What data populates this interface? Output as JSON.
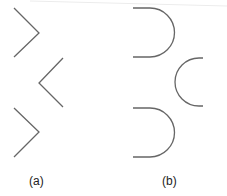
{
  "figure": {
    "stroke_color": "#666666",
    "panels": [
      {
        "label": "(a)",
        "shape": "chevron",
        "items": [
          {
            "orientation": "right-pointing",
            "points": [
              [
                14,
                8
              ],
              [
                39,
                33
              ],
              [
                14,
                57
              ]
            ]
          },
          {
            "orientation": "left-pointing",
            "points": [
              [
                63,
                58
              ],
              [
                39,
                83
              ],
              [
                63,
                107
              ]
            ]
          },
          {
            "orientation": "right-pointing",
            "points": [
              [
                14,
                108
              ],
              [
                39,
                132
              ],
              [
                14,
                157
              ]
            ]
          }
        ]
      },
      {
        "label": "(b)",
        "shape": "rounded-u",
        "items": [
          {
            "orientation": "opens-left"
          },
          {
            "orientation": "opens-right"
          },
          {
            "orientation": "opens-left"
          }
        ]
      }
    ]
  }
}
